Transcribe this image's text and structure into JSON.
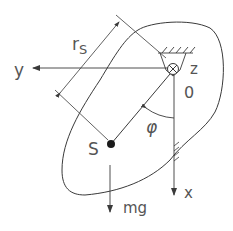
{
  "diagram": {
    "labels": {
      "radius": "r",
      "radius_sub": "S",
      "y_axis": "y",
      "z_axis": "z",
      "origin": "0",
      "angle": "φ",
      "center_of_mass": "S",
      "x_axis": "x",
      "weight": "mg"
    },
    "colors": {
      "stroke": "#3a3a3a",
      "text": "#555555",
      "background": "#ffffff"
    }
  }
}
